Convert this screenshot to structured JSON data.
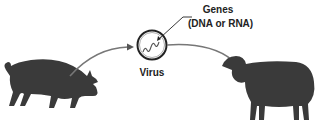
{
  "diagram": {
    "labels": {
      "genes": "Genes",
      "genes_detail": "(DNA or RNA)",
      "virus": "Virus"
    },
    "nodes": [
      {
        "id": "pig",
        "icon": "pig-icon"
      },
      {
        "id": "virus",
        "icon": "virus-icon"
      },
      {
        "id": "sheep",
        "icon": "sheep-icon"
      }
    ],
    "edges": [
      {
        "from": "pig",
        "to": "virus"
      },
      {
        "from": "virus",
        "to": "sheep"
      }
    ],
    "colors": {
      "silhouette": "#3a3a3a",
      "arrow": "#777777",
      "ink": "#222222"
    }
  }
}
